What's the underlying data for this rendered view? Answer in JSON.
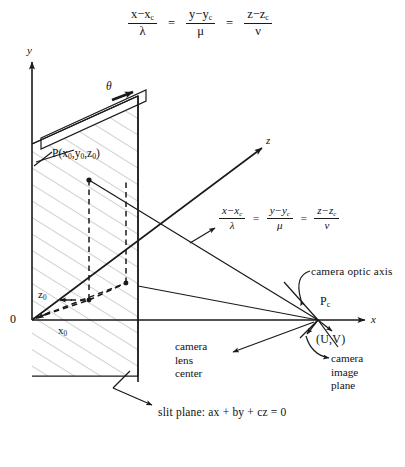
{
  "figure": {
    "type": "technical-line-diagram",
    "stroke_color": "#1a1a1a",
    "hatch_color": "#9a9a9a",
    "background": "#ffffff"
  },
  "equations": {
    "top": {
      "terms": [
        {
          "num": "x−x",
          "num_sub": "c",
          "den": "λ"
        },
        {
          "num": "y−y",
          "num_sub": "c",
          "den": "μ"
        },
        {
          "num": "z−z",
          "num_sub": "c",
          "den": "ν"
        }
      ],
      "separator": "="
    },
    "inner": {
      "terms": [
        {
          "num": "x−x",
          "num_sub": "c",
          "den": "λ"
        },
        {
          "num": "y−y",
          "num_sub": "c",
          "den": "μ"
        },
        {
          "num": "z−z",
          "num_sub": "c",
          "den": "ν"
        }
      ],
      "separator": "="
    }
  },
  "axes": {
    "y_label": "y",
    "z_label": "z",
    "x_label": "x",
    "origin_label": "0"
  },
  "labels": {
    "theta": "θ",
    "point_p": {
      "name": "P",
      "open": "(",
      "x": "x",
      "x_sub": "0",
      "c1": ",",
      "y": "y",
      "y_sub": "0",
      "c2": ",",
      "z": "z",
      "z_sub": "0",
      "close": ")"
    },
    "x0": {
      "base": "x",
      "sub": "0"
    },
    "z0": {
      "base": "z",
      "sub": "0"
    },
    "pc": {
      "base": "P",
      "sub": "c"
    },
    "uv": "(U,V)",
    "camera_optic_axis": "camera optic axis",
    "camera_lens_center": [
      "camera",
      "lens",
      "center"
    ],
    "camera_image_plane": [
      "camera",
      "image",
      "plane"
    ],
    "slit_plane_caption": "slit plane: ax + by + cz = 0"
  }
}
